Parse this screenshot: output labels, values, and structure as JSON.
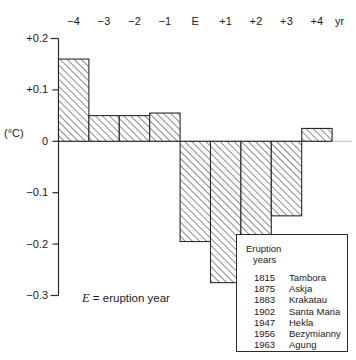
{
  "chart_data": {
    "type": "bar",
    "title": "",
    "xlabel": "yr",
    "ylabel": "(°C)",
    "categories": [
      "-4",
      "-3",
      "-2",
      "-1",
      "E",
      "+1",
      "+2",
      "+3",
      "+4"
    ],
    "values": [
      0.16,
      0.05,
      0.05,
      0.055,
      -0.195,
      -0.275,
      -0.185,
      -0.145,
      0.025
    ],
    "ylim": [
      -0.3,
      0.2
    ],
    "ytick_labels": [
      "+0.2",
      "+0.1",
      "0",
      "−0.1",
      "−0.2",
      "−0.3"
    ],
    "ytick_values": [
      0.2,
      0.1,
      0,
      -0.1,
      -0.2,
      -0.3
    ],
    "xtick_labels": [
      "−4",
      "−3",
      "−2",
      "−1",
      "E",
      "+1",
      "+2",
      "+3",
      "+4"
    ],
    "x_unit": "yr",
    "grid": false,
    "legend_position": "inside-bottom-right",
    "bar_fill": "hatched-45",
    "annotation": "E = eruption year"
  },
  "axis": {
    "y_unit": "(°C)",
    "x_unit": "yr"
  },
  "caption": {
    "symbol": "E",
    "text": "= eruption year"
  },
  "legend": {
    "title_line1": "Eruption",
    "title_line2": "years",
    "rows": [
      {
        "year": "1815",
        "name": "Tambora"
      },
      {
        "year": "1875",
        "name": "Askja"
      },
      {
        "year": "1883",
        "name": "Krakatau"
      },
      {
        "year": "1902",
        "name": "Santa Maria"
      },
      {
        "year": "1947",
        "name": "Hekla"
      },
      {
        "year": "1956",
        "name": "Bezymianny"
      },
      {
        "year": "1963",
        "name": "Agung"
      }
    ]
  },
  "colors": {
    "axis": "#2b2b2b",
    "bar_stroke": "#2b2b2b",
    "bar_hatch": "#6e6e6e",
    "background": "#ffffff"
  }
}
